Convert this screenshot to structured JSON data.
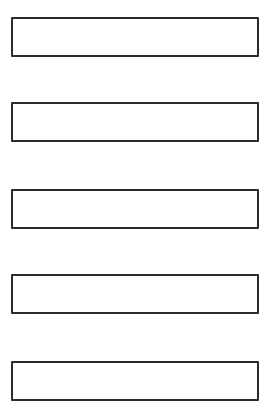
{
  "fields": [
    {
      "value": "",
      "top": 17
    },
    {
      "value": "",
      "top": 102
    },
    {
      "value": "",
      "top": 189
    },
    {
      "value": "",
      "top": 274
    },
    {
      "value": "",
      "top": 361
    }
  ],
  "colors": {
    "border": "#2a2a2a",
    "background": "#ffffff"
  }
}
